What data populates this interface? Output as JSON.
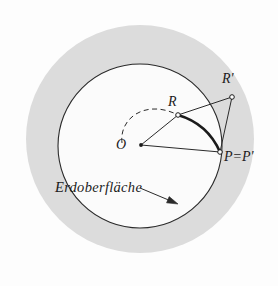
{
  "figure": {
    "kind": "geometry-diagram",
    "caption_language": "de",
    "background_color": "#fdfdfd",
    "outer_disk": {
      "name": "atmosphere-disk",
      "fill": "#dcdcdc",
      "stroke": "none",
      "cx": 140,
      "cy": 139,
      "r": 114
    },
    "inner_disk": {
      "name": "earth-disk",
      "fill": "#fbfbfb",
      "stroke": "#2a2a2a",
      "stroke_width": 1.1,
      "cx": 140,
      "cy": 146,
      "r": 82
    },
    "points": [
      {
        "id": "O",
        "label": "O",
        "x": 141,
        "y": 145,
        "marker": "dot"
      },
      {
        "id": "R",
        "label": "R",
        "x": 178,
        "y": 115,
        "marker": "open-circle"
      },
      {
        "id": "Rp",
        "label": "R'",
        "x": 232,
        "y": 97,
        "marker": "open-circle"
      },
      {
        "id": "P",
        "label": "P=P'",
        "x": 220,
        "y": 152,
        "marker": "open-circle"
      }
    ],
    "segments": [
      {
        "name": "segment-O-R",
        "from": "O",
        "to": "R"
      },
      {
        "name": "segment-R-Rp",
        "from": "R",
        "to": "Rp"
      },
      {
        "name": "segment-O-P",
        "from": "O",
        "to": "P"
      },
      {
        "name": "segment-P-Rp",
        "from": "P",
        "to": "Rp"
      }
    ],
    "bold_arc": {
      "name": "refracted-ray-arc",
      "from": "R",
      "to": "P",
      "bulge": "right",
      "stroke_width": 2.6
    },
    "dashed_arc": {
      "name": "dashed-reference-arc",
      "stroke_dasharray": "5 3.5",
      "description": "dashed arc sweeping from left of O up to R"
    },
    "annotation": {
      "name": "surface-annotation",
      "text": "Erdoberfläche",
      "arrow": {
        "from_x": 140,
        "from_y": 188,
        "to_x": 178,
        "to_y": 204
      }
    },
    "stroke_color": "#2a2a2a"
  }
}
